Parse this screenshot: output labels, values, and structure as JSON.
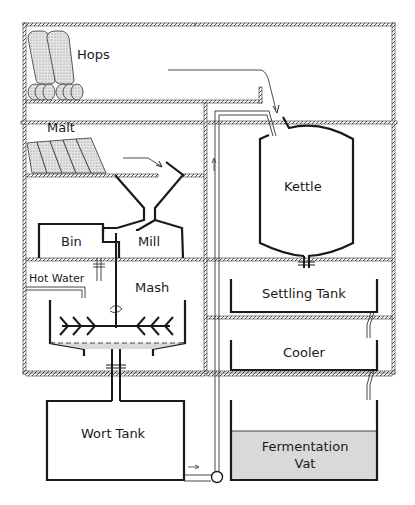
{
  "diagram": {
    "labels": {
      "hops": "Hops",
      "malt": "Malt",
      "bin": "Bin",
      "mill": "Mill",
      "hot_water": "Hot Water",
      "mash": "Mash",
      "wort_tank": "Wort Tank",
      "kettle": "Kettle",
      "settling_tank": "Settling Tank",
      "cooler": "Cooler",
      "fermentation_vat_line1": "Fermentation",
      "fermentation_vat_line2": "Vat"
    },
    "colors": {
      "ink": "#1a1a1a",
      "wall_hatch": "#555555",
      "liquid_fill": "#d9d9d9",
      "sack_fill": "#cfcfcf"
    },
    "flow": [
      "Malt → Mill",
      "Mill → Bin",
      "Bin + Hot Water → Mash",
      "Mash → Wort Tank",
      "Wort Tank → pump → Kettle",
      "Hops → Kettle",
      "Kettle → Settling Tank",
      "Settling Tank → Cooler",
      "Cooler → Fermentation Vat"
    ]
  }
}
